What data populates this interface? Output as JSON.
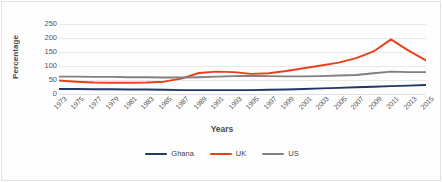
{
  "chart_data": {
    "type": "line",
    "title": "",
    "xlabel": "Years",
    "ylabel": "Percentage",
    "ylim": [
      0,
      250
    ],
    "yticks": [
      0,
      50,
      100,
      150,
      200,
      250
    ],
    "grid": true,
    "legend_position": "bottom-center",
    "x": [
      1973,
      1975,
      1977,
      1979,
      1981,
      1983,
      1985,
      1987,
      1989,
      1991,
      1993,
      1995,
      1997,
      1999,
      2001,
      2003,
      2005,
      2007,
      2009,
      2011,
      2013,
      2015
    ],
    "categories": [
      "1973",
      "1975",
      "1977",
      "1979",
      "1981",
      "1983",
      "1985",
      "1987",
      "1989",
      "1991",
      "1993",
      "1995",
      "1997",
      "1999",
      "2001",
      "2003",
      "2005",
      "2007",
      "2009",
      "2011",
      "2013",
      "2015"
    ],
    "series": [
      {
        "name": "Ghana",
        "color": "#1F3864",
        "values": [
          18,
          18,
          17,
          17,
          16,
          16,
          15,
          14,
          14,
          14,
          14,
          14,
          15,
          16,
          18,
          20,
          22,
          24,
          26,
          28,
          30,
          32
        ]
      },
      {
        "name": "UK",
        "color": "#E8401C",
        "values": [
          48,
          44,
          41,
          40,
          40,
          41,
          44,
          55,
          75,
          80,
          78,
          72,
          74,
          82,
          92,
          102,
          112,
          128,
          152,
          195,
          155,
          120
        ]
      },
      {
        "name": "US",
        "color": "#808080",
        "values": [
          62,
          62,
          61,
          61,
          60,
          60,
          59,
          59,
          60,
          62,
          64,
          65,
          64,
          63,
          63,
          64,
          66,
          68,
          74,
          80,
          78,
          78
        ]
      }
    ]
  },
  "axes": {
    "y_title": "Percentage",
    "x_title": "Years"
  },
  "legend": {
    "items": [
      {
        "label": "Ghana",
        "color": "#1F3864"
      },
      {
        "label": "UK",
        "color": "#E8401C"
      },
      {
        "label": "US",
        "color": "#808080"
      }
    ]
  }
}
